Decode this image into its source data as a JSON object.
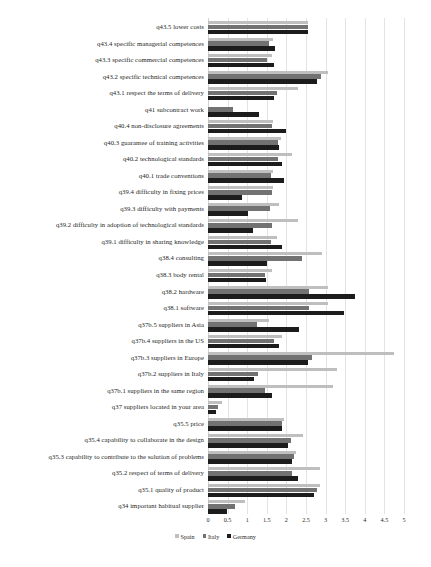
{
  "chart_data": {
    "type": "bar",
    "orientation": "horizontal",
    "title": "",
    "xlabel": "",
    "ylabel": "",
    "xlim": [
      0,
      5
    ],
    "grid": true,
    "legend_position": "bottom",
    "tick_labels": [
      "0",
      "0.5",
      "1",
      "1.5",
      "2",
      "2.5",
      "3",
      "3.5",
      "4",
      "4.5",
      "5"
    ],
    "tick_values": [
      0,
      0.5,
      1,
      1.5,
      2,
      2.5,
      3,
      3.5,
      4,
      4.5,
      5
    ],
    "categories": [
      "q43.5 lower costs",
      "q43.4 specific managerial competences",
      "q43.3 specific commercial competences",
      "q43.2 specific technical competences",
      "q43.1 respect the terms of delivery",
      "q41 subcontract work",
      "q40.4 non-disclosure agreements",
      "q40.3 guarantee of training activities",
      "q40.2 technological standards",
      "q40.1 trade conventions",
      "q39.4 difficulty in fixing prices",
      "q39.3 difficulty with payments",
      "q39.2 difficulty in adoption of technological standards",
      "q39.1 difficulty in sharing knowledge",
      "q38.4 consulting",
      "q38.3 body rental",
      "q38.2 hardware",
      "q38.1 software",
      "q37b.5 suppliers in Asia",
      "q37b.4 suppliers in the US",
      "q37b.3 suppliers in Europe",
      "q37b.2 suppliers in Italy",
      "q37b.1 suppliers in the same region",
      "q37 suppliers located in your area",
      "q35.5 price",
      "q35.4 capability to collaborate in the design",
      "q35.3 capability to contribute to the solution of problems",
      "q35.2 respect of terms of delivery",
      "q35.1 quality of product",
      "q34 important habitual supplier"
    ],
    "series": [
      {
        "name": "Spain",
        "color": "#bfbfbf",
        "values": [
          2.55,
          1.65,
          1.62,
          3.05,
          2.3,
          0.0,
          1.65,
          1.85,
          2.15,
          1.65,
          1.65,
          1.8,
          2.3,
          1.75,
          2.9,
          1.62,
          3.05,
          3.05,
          1.55,
          1.88,
          4.75,
          3.3,
          3.2,
          0.35,
          1.95,
          2.42,
          2.25,
          2.85,
          2.85,
          0.95
        ]
      },
      {
        "name": "Italy",
        "color": "#727272",
        "values": [
          2.55,
          1.55,
          1.5,
          2.88,
          1.75,
          0.63,
          1.62,
          1.78,
          1.78,
          1.6,
          1.62,
          1.58,
          1.62,
          1.6,
          2.4,
          1.45,
          2.58,
          2.58,
          1.25,
          1.68,
          2.65,
          1.28,
          1.45,
          0.25,
          1.9,
          2.12,
          2.2,
          2.15,
          2.78,
          0.7
        ]
      },
      {
        "name": "Germany",
        "color": "#1c1c1c",
        "values": [
          2.55,
          1.72,
          1.68,
          2.78,
          1.68,
          1.3,
          2.0,
          1.8,
          1.88,
          1.95,
          0.87,
          1.02,
          1.15,
          1.9,
          1.5,
          1.48,
          3.75,
          3.48,
          2.32,
          1.8,
          2.55,
          1.18,
          1.62,
          0.2,
          1.9,
          2.05,
          2.15,
          2.3,
          2.7,
          0.48
        ]
      }
    ]
  },
  "legend": {
    "entries": [
      {
        "label": "Spain",
        "color": "#bfbfbf"
      },
      {
        "label": "Italy",
        "color": "#727272"
      },
      {
        "label": "Germany",
        "color": "#1c1c1c"
      }
    ]
  },
  "caption": {
    "text": ""
  }
}
